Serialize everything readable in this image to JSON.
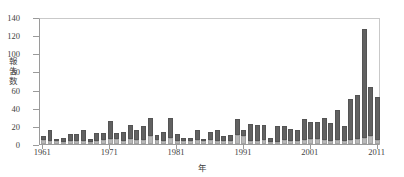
{
  "chart_data": {
    "type": "bar",
    "stacked": true,
    "title": "",
    "xlabel": "年",
    "ylabel": "報告数",
    "ylim": [
      0,
      140
    ],
    "yticks": [
      0,
      20,
      40,
      60,
      80,
      100,
      120,
      140
    ],
    "xtick_labels": [
      "1961",
      "1971",
      "1981",
      "1991",
      "2001",
      "2011"
    ],
    "xtick_years": [
      1961,
      1971,
      1981,
      1991,
      2001,
      2011
    ],
    "grid": false,
    "legend": "none",
    "colors": {
      "lower_segment": "#b9b9b9",
      "upper_segment": "#616161",
      "axis": "#9a9a9a",
      "text": "#3f3f3f",
      "background": "#ffffff"
    },
    "categories": [
      1961,
      1962,
      1963,
      1964,
      1965,
      1966,
      1967,
      1968,
      1969,
      1970,
      1971,
      1972,
      1973,
      1974,
      1975,
      1976,
      1977,
      1978,
      1979,
      1980,
      1981,
      1982,
      1983,
      1984,
      1985,
      1986,
      1987,
      1988,
      1989,
      1990,
      1991,
      1992,
      1993,
      1994,
      1995,
      1996,
      1997,
      1998,
      1999,
      2000,
      2001,
      2002,
      2003,
      2004,
      2005,
      2006,
      2007,
      2008,
      2009,
      2010,
      2011
    ],
    "series": [
      {
        "name": "lower",
        "values": [
          4,
          3,
          3,
          2,
          3,
          3,
          3,
          2,
          3,
          4,
          6,
          5,
          3,
          5,
          4,
          4,
          9,
          4,
          3,
          7,
          3,
          3,
          3,
          4,
          3,
          4,
          3,
          3,
          3,
          10,
          9,
          3,
          3,
          4,
          2,
          2,
          4,
          3,
          3,
          4,
          6,
          5,
          4,
          3,
          4,
          3,
          4,
          5,
          7,
          9,
          4
        ]
      },
      {
        "name": "upper",
        "values": [
          5,
          13,
          2,
          4,
          8,
          8,
          13,
          3,
          9,
          8,
          19,
          7,
          10,
          16,
          11,
          16,
          20,
          6,
          10,
          22,
          8,
          4,
          4,
          12,
          3,
          9,
          13,
          6,
          7,
          18,
          6,
          19,
          18,
          17,
          4,
          18,
          16,
          14,
          13,
          24,
          18,
          19,
          25,
          20,
          33,
          17,
          46,
          49,
          120,
          54,
          48
        ]
      }
    ],
    "totals": [
      9,
      16,
      5,
      6,
      11,
      11,
      16,
      5,
      12,
      12,
      25,
      12,
      13,
      21,
      15,
      20,
      29,
      10,
      13,
      29,
      11,
      7,
      7,
      16,
      6,
      13,
      16,
      9,
      10,
      28,
      15,
      22,
      21,
      21,
      6,
      20,
      20,
      17,
      16,
      28,
      24,
      24,
      29,
      23,
      37,
      20,
      50,
      54,
      127,
      63,
      52
    ]
  }
}
